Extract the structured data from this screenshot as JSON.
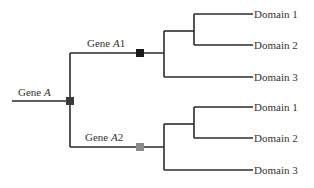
{
  "diagram": {
    "root": {
      "label": "Gene ",
      "label_italic": "A",
      "marker_color": "#3a3a3a"
    },
    "branch_a1": {
      "label": "Gene ",
      "label_italic": "A",
      "label_suffix": "1",
      "marker_color": "#1a1a1a"
    },
    "branch_a2": {
      "label": "Gene ",
      "label_italic": "A",
      "label_suffix": "2",
      "marker_color": "#8c8c8c"
    },
    "a1_domains": [
      "Domain 1",
      "Domain 2",
      "Domain 3"
    ],
    "a2_domains": [
      "Domain 1",
      "Domain 2",
      "Domain 3"
    ]
  },
  "colors": {
    "line": "#2b2b2b",
    "text": "#333333",
    "background": "#ffffff"
  }
}
